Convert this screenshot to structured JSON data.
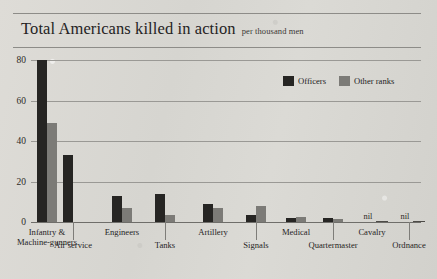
{
  "header": {
    "title": "Total Americans killed in action",
    "subtitle": "per thousand men"
  },
  "legend": {
    "position": "top-right",
    "items": [
      {
        "label": "Officers",
        "color": "#262523"
      },
      {
        "label": "Other ranks",
        "color": "#7c7b77"
      }
    ]
  },
  "axis": {
    "yticks": [
      "0",
      "20",
      "40",
      "60",
      "80"
    ],
    "nil_label": "nil"
  },
  "chart_data": {
    "type": "bar",
    "title": "Total Americans killed in action",
    "subtitle": "per thousand men",
    "xlabel": "",
    "ylabel": "per thousand men",
    "ylim": [
      0,
      80
    ],
    "yticks": [
      0,
      20,
      40,
      60,
      80
    ],
    "grid": true,
    "legend_position": "top-right",
    "categories": [
      "Infantry & Machine-gunners",
      "Air service",
      "Engineers",
      "Tanks",
      "Artillery",
      "Signals",
      "Medical",
      "Quartermaster",
      "Cavalry",
      "Ordnance"
    ],
    "series": [
      {
        "name": "Officers",
        "color": "#262523",
        "values": [
          80,
          33,
          13,
          14,
          9,
          3.5,
          2,
          2,
          0,
          0
        ]
      },
      {
        "name": "Other ranks",
        "color": "#7c7b77",
        "values": [
          49,
          0,
          7,
          3.5,
          7,
          8,
          2.5,
          1.5,
          0,
          0
        ]
      }
    ],
    "annotations": [
      {
        "category": "Cavalry",
        "text": "nil"
      },
      {
        "category": "Ordnance",
        "text": "nil"
      }
    ]
  },
  "labels": {
    "groups": [
      {
        "name": "Infantry & Machine-gunners",
        "line1": "Infantry &",
        "line2": "Machine-gunners"
      },
      {
        "name": "Air service",
        "line1": "Air service",
        "line2": ""
      },
      {
        "name": "Engineers",
        "line1": "Engineers",
        "line2": ""
      },
      {
        "name": "Tanks",
        "line1": "Tanks",
        "line2": ""
      },
      {
        "name": "Artillery",
        "line1": "Artillery",
        "line2": ""
      },
      {
        "name": "Signals",
        "line1": "Signals",
        "line2": ""
      },
      {
        "name": "Medical",
        "line1": "Medical",
        "line2": ""
      },
      {
        "name": "Quartermaster",
        "line1": "Quartermaster",
        "line2": ""
      },
      {
        "name": "Cavalry",
        "line1": "Cavalry",
        "line2": ""
      },
      {
        "name": "Ordnance",
        "line1": "Ordnance",
        "line2": ""
      }
    ]
  }
}
